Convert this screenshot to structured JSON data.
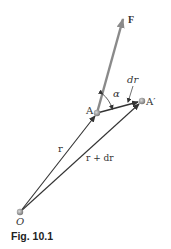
{
  "figure": {
    "caption": "Fig. 10.1",
    "labels": {
      "force": "F",
      "point_A": "A",
      "point_A_prime": "A′",
      "origin": "O",
      "angle": "α",
      "displacement": "dr",
      "position": "r",
      "position_plus_displacement": "r + dr"
    },
    "colors": {
      "force_vector": "#8a8a8a",
      "vectors": "#333333",
      "points": "#999999"
    }
  }
}
